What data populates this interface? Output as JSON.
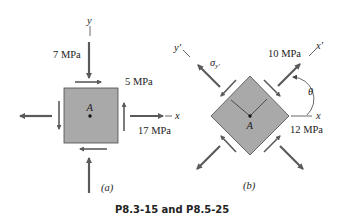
{
  "caption": "P8.3-15 and P8.5-25",
  "colors": {
    "element_fill": "#a9a9a9",
    "element_stroke": "#4a4a4a",
    "arrow": "#5a5a5a",
    "text": "#222222"
  },
  "figure_a": {
    "label": "(a)",
    "axis_x": "x",
    "axis_y": "y",
    "point": "A",
    "stress_y": "7 MPa",
    "shear": "5 MPa",
    "stress_x": "17 MPa"
  },
  "figure_b": {
    "label": "(b)",
    "axis_x": "x",
    "axis_x_prime": "x′",
    "axis_y_prime": "y′",
    "point": "A",
    "sigma_y_prime": "σ",
    "sigma_y_prime_sub": "y′",
    "stress_x_prime": "10 MPa",
    "shear": "12 MPa",
    "angle": "θ"
  }
}
